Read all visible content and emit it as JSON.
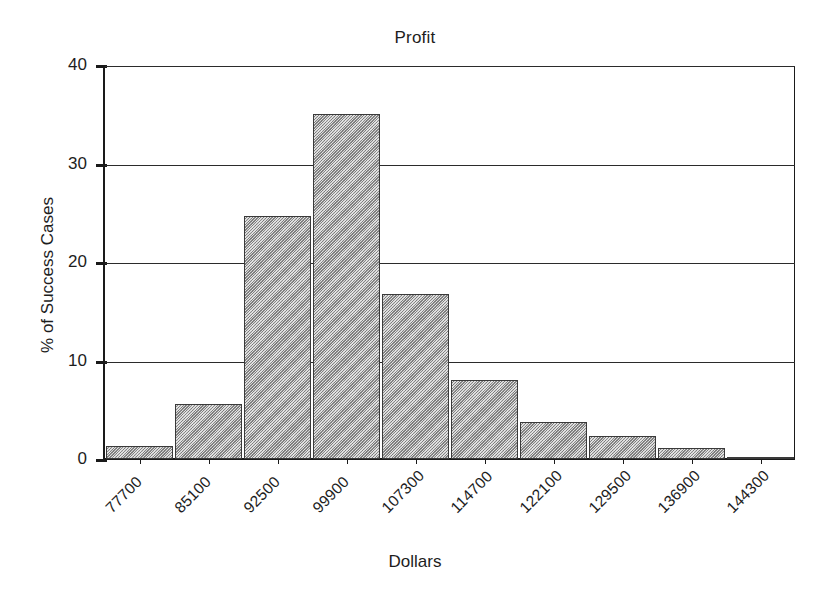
{
  "chart_data": {
    "type": "bar",
    "title": "Profit",
    "xlabel": "Dollars",
    "ylabel": "% of Success Cases",
    "categories": [
      "77700",
      "85100",
      "92500",
      "99900",
      "107300",
      "114700",
      "122100",
      "129500",
      "136900",
      "144300"
    ],
    "values": [
      1.3,
      5.6,
      24.7,
      35.0,
      16.8,
      8.0,
      3.8,
      2.3,
      1.1,
      0.15
    ],
    "ylim": [
      0,
      40
    ],
    "yticks": [
      "0",
      "10",
      "20",
      "30",
      "40"
    ],
    "ytick_values": [
      0,
      10,
      20,
      30,
      40
    ],
    "grid": true,
    "legend": "none",
    "bar_fill_color": "#b4b4b4",
    "bar_edge_color": "#3a3a3a",
    "axis_color": "#1a1a1a",
    "background_color": "#ffffff"
  }
}
